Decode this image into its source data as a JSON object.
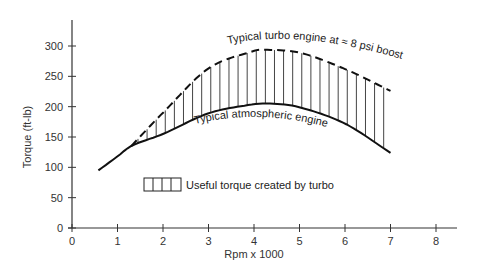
{
  "chart_data": {
    "type": "line",
    "title": "",
    "xlabel": "Rpm x 1000",
    "ylabel": "Torque (ft-lb)",
    "xlim": [
      0,
      8
    ],
    "ylim": [
      0,
      300
    ],
    "xticks": [
      0,
      1,
      2,
      3,
      4,
      5,
      6,
      7,
      8
    ],
    "yticks": [
      0,
      50,
      100,
      150,
      200,
      250,
      300
    ],
    "grid": false,
    "series": [
      {
        "name": "Typical turbo engine at ≈ 8 psi boost",
        "style": "dashed",
        "x": [
          1.3,
          2,
          3,
          4,
          4.2,
          5,
          6,
          7
        ],
        "y": [
          135,
          190,
          263,
          292,
          294,
          289,
          262,
          226
        ]
      },
      {
        "name": "Typical atmospheric engine",
        "style": "solid",
        "x": [
          0.58,
          1,
          1.3,
          2,
          3,
          4,
          4.4,
          5,
          6,
          7
        ],
        "y": [
          95,
          118,
          135,
          155,
          189,
          204,
          205,
          199,
          172,
          124
        ]
      }
    ],
    "shaded_region": {
      "label": "Useful torque created by turbo",
      "between": [
        "Typical turbo engine at ≈ 8 psi boost",
        "Typical atmospheric engine"
      ],
      "pattern": "vertical-hatch",
      "x_range": [
        1.3,
        7
      ]
    },
    "annotations": [
      {
        "text": "Typical turbo engine at ≈ 8 psi boost",
        "x": 4.6,
        "y": 300
      },
      {
        "text": "Typical atmospheric engine",
        "x": 3.9,
        "y": 188
      }
    ],
    "legend": {
      "position": "inside-bottom-left",
      "entries": [
        "Useful torque created by turbo"
      ]
    }
  },
  "labels": {
    "ylabel": "Torque (ft-lb)",
    "xlabel": "Rpm x 1000",
    "turbo": "Typical turbo engine at ≈ 8 psi boost",
    "atmo": "Typical atmospheric engine",
    "legend": "Useful torque created by turbo",
    "xticks": [
      "0",
      "1",
      "2",
      "3",
      "4",
      "5",
      "6",
      "7",
      "8"
    ],
    "yticks": [
      "0",
      "50",
      "100",
      "150",
      "200",
      "250",
      "300"
    ]
  }
}
